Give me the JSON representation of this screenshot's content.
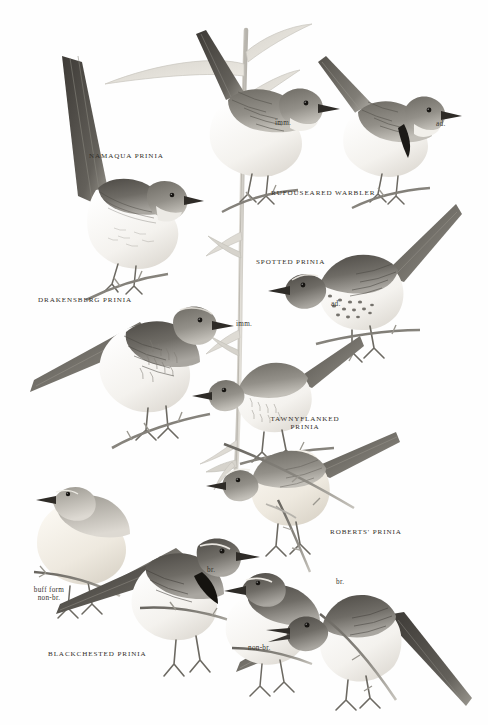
{
  "plate": {
    "title": "Prinias and Rufous-eared Warbler field guide plate",
    "background_color": "#ffffff",
    "ink_color": "#2a2723",
    "width": 488,
    "height": 725
  },
  "species_labels": [
    {
      "name": "namaqua-prinia",
      "text": "NAMAQUA PRINIA",
      "x": 89,
      "y": 152,
      "align": "left"
    },
    {
      "name": "rufouseared-warbler",
      "text": "RUFOUSEARED WARBLER",
      "x": 271,
      "y": 189,
      "align": "left"
    },
    {
      "name": "drakensberg-prinia",
      "text": "DRAKENSBERG PRINIA",
      "x": 38,
      "y": 296,
      "align": "left"
    },
    {
      "name": "spotted-prinia",
      "text": "SPOTTED PRINIA",
      "x": 256,
      "y": 258,
      "align": "left"
    },
    {
      "name": "tawnyflanked-prinia",
      "text": "TAWNYFLANKED\nPRINIA",
      "x": 305,
      "y": 415,
      "align": "center"
    },
    {
      "name": "roberts-prinia",
      "text": "ROBERTS' PRINIA",
      "x": 330,
      "y": 528,
      "align": "left"
    },
    {
      "name": "blackchested-prinia",
      "text": "BLACKCHESTED PRINIA",
      "x": 48,
      "y": 650,
      "align": "left"
    }
  ],
  "age_labels": [
    {
      "name": "rufouseared-imm",
      "text": "imm.",
      "x": 275,
      "y": 119,
      "align": "left"
    },
    {
      "name": "rufouseared-ad",
      "text": "ad.",
      "x": 436,
      "y": 120,
      "align": "left"
    },
    {
      "name": "spotted-ad",
      "text": "ad.",
      "x": 331,
      "y": 300,
      "align": "left"
    },
    {
      "name": "spotted-imm",
      "text": "imm.",
      "x": 236,
      "y": 320,
      "align": "left"
    },
    {
      "name": "blackchested-buff",
      "text": "buff form\nnon-br.",
      "x": 49,
      "y": 586,
      "align": "center"
    },
    {
      "name": "blackchested-br",
      "text": "br.",
      "x": 207,
      "y": 566,
      "align": "left"
    },
    {
      "name": "blackchested-nonbr",
      "text": "non-br.",
      "x": 248,
      "y": 644,
      "align": "left"
    },
    {
      "name": "roberts-br",
      "text": "br.",
      "x": 336,
      "y": 578,
      "align": "left"
    }
  ],
  "illustrations": [
    {
      "name": "bird-namaqua-prinia",
      "common_name": "Namaqua Prinia",
      "pose": "perched, long cocked tail, facing right"
    },
    {
      "name": "bird-rufouseared-warbler-imm",
      "common_name": "Rufous-eared Warbler",
      "pose": "immature, perched on reed, facing right"
    },
    {
      "name": "bird-rufouseared-warbler-ad",
      "common_name": "Rufous-eared Warbler",
      "pose": "adult with black breast band, facing right"
    },
    {
      "name": "bird-drakensberg-prinia",
      "common_name": "Drakensberg Prinia",
      "pose": "perched, streaked breast, facing right"
    },
    {
      "name": "bird-spotted-prinia-ad",
      "common_name": "Spotted Prinia",
      "pose": "adult, spotted breast, facing left"
    },
    {
      "name": "bird-spotted-prinia-imm",
      "common_name": "Spotted Prinia",
      "pose": "immature, facing left"
    },
    {
      "name": "bird-tawnyflanked-prinia",
      "common_name": "Tawny-flanked Prinia",
      "pose": "perched on twig, facing left"
    },
    {
      "name": "bird-blackchested-buff",
      "common_name": "Black-chested Prinia",
      "pose": "buff form non-breeding, facing right"
    },
    {
      "name": "bird-blackchested-br",
      "common_name": "Black-chested Prinia",
      "pose": "breeding, black breast band, facing right"
    },
    {
      "name": "bird-blackchested-nonbr",
      "common_name": "Black-chested Prinia",
      "pose": "non-breeding, facing right"
    },
    {
      "name": "bird-roberts-prinia",
      "common_name": "Roberts' Prinia",
      "pose": "breeding, singing, facing left"
    },
    {
      "name": "reed-stem-main",
      "common_name": "Reed stem",
      "pose": "vertical stalk with leaves through centre of plate"
    }
  ]
}
